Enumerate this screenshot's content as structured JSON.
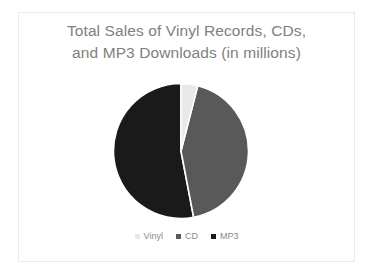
{
  "slide": {
    "background_color": "#ffffff",
    "border_color": "#e9e9e9"
  },
  "title": {
    "line1": "Total Sales of Vinyl Records, CDs,",
    "line2": "and MP3 Downloads (in millions)",
    "color": "#808080"
  },
  "legend": {
    "position": "bottom",
    "items": [
      {
        "label": "Vinyl",
        "color": "#e8e8e8",
        "marker": "square-marker"
      },
      {
        "label": "CD",
        "color": "#595959",
        "marker": "square-marker"
      },
      {
        "label": "MP3",
        "color": "#1a1a1a",
        "marker": "square-marker"
      }
    ]
  },
  "chart_data": {
    "type": "pie",
    "title": "Total Sales of Vinyl Records, CDs, and MP3 Downloads (in millions)",
    "xlabel": "",
    "ylabel": "",
    "categories": [
      "Vinyl",
      "CD",
      "MP3"
    ],
    "values": [
      4,
      43,
      53
    ],
    "unit": "percent",
    "colors": [
      "#e8e8e8",
      "#595959",
      "#1a1a1a"
    ],
    "slice_separator_color": "#ffffff",
    "start_angle_deg": 0,
    "direction": "clockwise",
    "data_labels_shown": false,
    "grid": false,
    "legend_position": "bottom",
    "slices": [
      {
        "name": "Vinyl",
        "value": 4,
        "color": "#e8e8e8",
        "start_deg": 0,
        "end_deg": 14.4
      },
      {
        "name": "CD",
        "value": 43,
        "color": "#595959",
        "start_deg": 14.4,
        "end_deg": 169.2
      },
      {
        "name": "MP3",
        "value": 53,
        "color": "#1a1a1a",
        "start_deg": 169.2,
        "end_deg": 360
      }
    ]
  }
}
